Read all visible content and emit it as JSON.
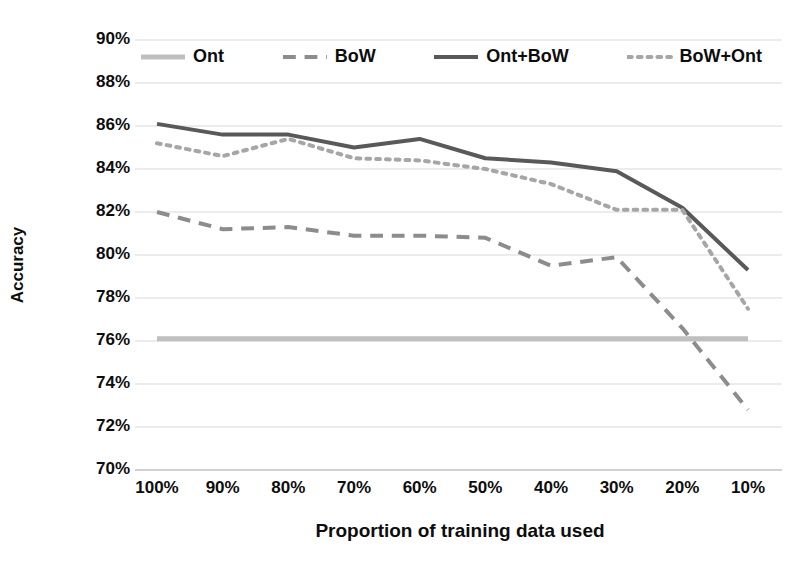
{
  "chart_data": {
    "type": "line",
    "title": "",
    "xlabel": "Proportion of training data used",
    "ylabel": "Accuracy",
    "categories": [
      "100%",
      "90%",
      "80%",
      "70%",
      "60%",
      "50%",
      "40%",
      "30%",
      "20%",
      "10%"
    ],
    "ylim": [
      70,
      90
    ],
    "ytick_labels": [
      "90%",
      "88%",
      "86%",
      "84%",
      "82%",
      "80%",
      "78%",
      "76%",
      "74%",
      "72%",
      "70%"
    ],
    "ytick_values": [
      90,
      88,
      86,
      84,
      82,
      80,
      78,
      76,
      74,
      72,
      70
    ],
    "grid": true,
    "legend_position": "top-inside",
    "series": [
      {
        "name": "Ont",
        "style": "solid-light",
        "color": "#bfbfbf",
        "width": 5,
        "values": [
          76.1,
          76.1,
          76.1,
          76.1,
          76.1,
          76.1,
          76.1,
          76.1,
          76.1,
          76.1
        ]
      },
      {
        "name": "BoW",
        "style": "dashed",
        "color": "#8c8c8c",
        "width": 4,
        "values": [
          82.0,
          81.2,
          81.3,
          80.9,
          80.9,
          80.8,
          79.5,
          79.9,
          76.6,
          72.8
        ]
      },
      {
        "name": "Ont+BoW",
        "style": "solid",
        "color": "#595959",
        "width": 4,
        "values": [
          86.1,
          85.6,
          85.6,
          85.0,
          85.4,
          84.5,
          84.3,
          83.9,
          82.2,
          79.3
        ]
      },
      {
        "name": "BoW+Ont",
        "style": "dotted",
        "color": "#a6a6a6",
        "width": 4,
        "values": [
          85.2,
          84.6,
          85.4,
          84.5,
          84.4,
          84.0,
          83.3,
          82.1,
          82.1,
          77.5
        ]
      }
    ]
  },
  "legend": {
    "entries": [
      {
        "label": "Ont"
      },
      {
        "label": "BoW"
      },
      {
        "label": "Ont+BoW"
      },
      {
        "label": "BoW+Ont"
      }
    ]
  },
  "axes": {
    "y_title": "Accuracy",
    "x_title": "Proportion of training data used"
  }
}
